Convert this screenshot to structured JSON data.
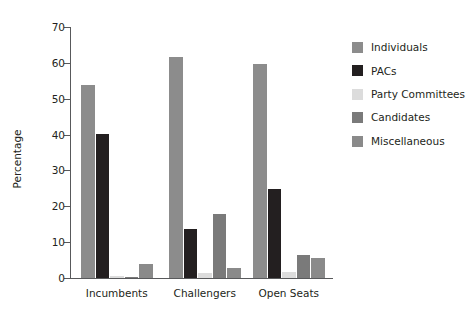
{
  "chart_data": {
    "type": "bar",
    "title": "",
    "xlabel": "",
    "ylabel": "Percentage",
    "ylim": [
      0,
      70
    ],
    "yticks": [
      0,
      10,
      20,
      30,
      40,
      50,
      60,
      70
    ],
    "grid": false,
    "legend_position": "right",
    "categories": [
      "Incumbents",
      "Challengers",
      "Open Seats"
    ],
    "series": [
      {
        "name": "Individuals",
        "color": "#8c8c8c",
        "values": [
          53.7,
          61.6,
          59.8
        ]
      },
      {
        "name": "PACs",
        "color": "#231f20",
        "values": [
          40.1,
          13.8,
          24.9
        ]
      },
      {
        "name": "Party Committees",
        "color": "#dcdcdc",
        "values": [
          0.7,
          1.4,
          1.8
        ]
      },
      {
        "name": "Candidates",
        "color": "#7a7a7a",
        "values": [
          0.4,
          17.9,
          6.4
        ]
      },
      {
        "name": "Miscellaneous",
        "color": "#8a8a8a",
        "values": [
          4.0,
          2.9,
          5.5
        ]
      }
    ]
  },
  "legend": {
    "items": [
      {
        "label": "Individuals"
      },
      {
        "label": "PACs"
      },
      {
        "label": "Party Committees"
      },
      {
        "label": "Candidates"
      },
      {
        "label": "Miscellaneous"
      }
    ]
  },
  "axis": {
    "y_title": "Percentage",
    "y_tick_labels": [
      "0",
      "10",
      "20",
      "30",
      "40",
      "50",
      "60",
      "70"
    ],
    "x_tick_labels": [
      "Incumbents",
      "Challengers",
      "Open Seats"
    ]
  }
}
